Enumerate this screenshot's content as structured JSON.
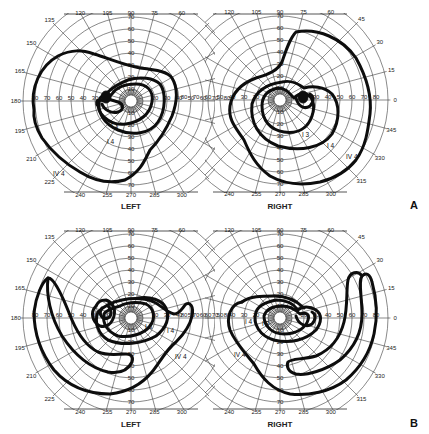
{
  "figure": {
    "panels": [
      {
        "label": "A",
        "eyes": [
          {
            "eye": "LEFT",
            "center": [
              131,
              101
            ],
            "isopters": [
              {
                "name": "IV 4",
                "label_pos": [
                  53,
                  174
                ]
              },
              {
                "name": "I 4",
                "label_pos": [
                  108,
                  142
                ]
              },
              {
                "name": "I 3",
                "label_pos": [
                  112,
                  126
                ]
              }
            ]
          },
          {
            "eye": "RIGHT",
            "center": [
              280,
              100
            ],
            "isopters": [
              {
                "name": "IV 4",
                "label_pos": [
                  345,
                  157
                ]
              },
              {
                "name": "I 4",
                "label_pos": [
                  330,
                  145
                ]
              },
              {
                "name": "I 3",
                "label_pos": [
                  303,
                  135
                ]
              }
            ]
          }
        ]
      },
      {
        "label": "B",
        "eyes": [
          {
            "eye": "LEFT",
            "center": [
              131,
              318
            ],
            "isopters": [
              {
                "name": "IV 4",
                "label_pos": [
                  175,
                  357
                ]
              },
              {
                "name": "I 4",
                "label_pos": [
                  168,
                  331
                ]
              },
              {
                "name": "I 3",
                "label_pos": [
                  148,
                  327
                ]
              }
            ]
          },
          {
            "eye": "RIGHT",
            "center": [
              280,
              318
            ],
            "isopters": [
              {
                "name": "IV 4",
                "label_pos": [
                  236,
                  355
                ]
              },
              {
                "name": "I 4",
                "label_pos": [
                  246,
                  322
                ]
              },
              {
                "name": "I 3",
                "label_pos": [
                  264,
                  324
                ]
              }
            ]
          }
        ]
      }
    ],
    "meridian_labels": [
      "0",
      "15",
      "30",
      "45",
      "60",
      "75",
      "90",
      "105",
      "120",
      "135",
      "150",
      "165",
      "180",
      "195",
      "210",
      "225",
      "240",
      "255",
      "270",
      "285",
      "300",
      "315",
      "330",
      "345"
    ],
    "eccentricity_labels": [
      "10",
      "20",
      "30",
      "40",
      "50",
      "60",
      "70",
      "80",
      "90"
    ],
    "horizontal_scale_labels": [
      "10",
      "20",
      "30",
      "40",
      "50",
      "60",
      "70",
      "80"
    ]
  },
  "chart_data": {
    "type": "polar-perimetry",
    "panels": [
      "A",
      "B"
    ],
    "eyes": [
      "LEFT",
      "RIGHT"
    ],
    "meridians_deg": [
      0,
      15,
      30,
      45,
      60,
      75,
      90,
      105,
      120,
      135,
      150,
      165,
      180,
      195,
      210,
      225,
      240,
      255,
      270,
      285,
      300,
      315,
      330,
      345
    ],
    "eccentricity_rings_deg": [
      10,
      20,
      30,
      40,
      50,
      60,
      70,
      80,
      90
    ],
    "isopters": [
      "IV 4",
      "I 4",
      "I 3"
    ],
    "series": [
      {
        "panel": "A",
        "eye": "LEFT",
        "isopter": "IV 4",
        "approx_extent_deg": {
          "temporal": 85,
          "superior": 50,
          "inferior": 65,
          "nasal": 45
        }
      },
      {
        "panel": "A",
        "eye": "LEFT",
        "isopter": "I 4",
        "approx_extent_deg": {
          "temporal": 30,
          "superior": 25,
          "inferior": 35,
          "nasal": 30
        }
      },
      {
        "panel": "A",
        "eye": "LEFT",
        "isopter": "I 3",
        "approx_extent_deg": {
          "temporal": 20,
          "superior": 15,
          "inferior": 25,
          "nasal": 20
        }
      },
      {
        "panel": "A",
        "eye": "RIGHT",
        "isopter": "IV 4",
        "approx_extent_deg": {
          "temporal": 80,
          "superior": 55,
          "inferior": 65,
          "nasal": 50
        }
      },
      {
        "panel": "A",
        "eye": "RIGHT",
        "isopter": "I 4",
        "approx_extent_deg": {
          "temporal": 45,
          "superior": 20,
          "inferior": 40,
          "nasal": 30
        }
      },
      {
        "panel": "A",
        "eye": "RIGHT",
        "isopter": "I 3",
        "approx_extent_deg": {
          "temporal": 30,
          "superior": 15,
          "inferior": 30,
          "nasal": 20
        }
      },
      {
        "panel": "B",
        "eye": "LEFT",
        "isopter": "IV 4",
        "approx_extent_deg": {
          "temporal": 80,
          "superior": 35,
          "inferior": 70,
          "nasal": 60
        }
      },
      {
        "panel": "B",
        "eye": "LEFT",
        "isopter": "I 4",
        "approx_extent_deg": {
          "temporal": 40,
          "superior": 20,
          "inferior": 30,
          "nasal": 40
        }
      },
      {
        "panel": "B",
        "eye": "LEFT",
        "isopter": "I 3",
        "approx_extent_deg": {
          "temporal": 30,
          "superior": 15,
          "inferior": 20,
          "nasal": 25
        }
      },
      {
        "panel": "B",
        "eye": "RIGHT",
        "isopter": "IV 4",
        "approx_extent_deg": {
          "temporal": 80,
          "superior": 35,
          "inferior": 70,
          "nasal": 55
        }
      },
      {
        "panel": "B",
        "eye": "RIGHT",
        "isopter": "I 4",
        "approx_extent_deg": {
          "temporal": 40,
          "superior": 20,
          "inferior": 30,
          "nasal": 35
        }
      },
      {
        "panel": "B",
        "eye": "RIGHT",
        "isopter": "I 3",
        "approx_extent_deg": {
          "temporal": 25,
          "superior": 15,
          "inferior": 20,
          "nasal": 25
        }
      }
    ]
  }
}
